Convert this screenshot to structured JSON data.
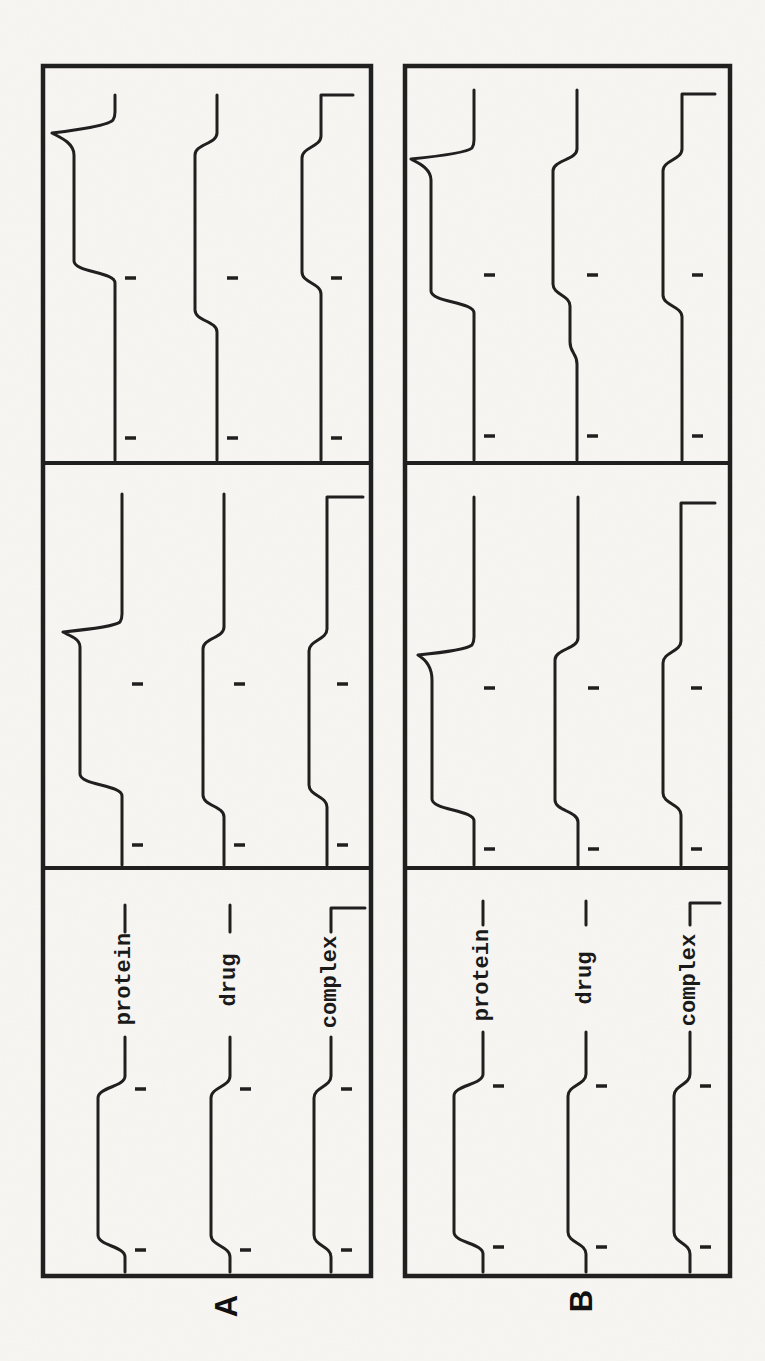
{
  "figure": {
    "kind": "scanned moving-boundary trace figure, rotated 90 degrees counterclockwise",
    "panel_letters": [
      "A",
      "B"
    ],
    "species_labels": [
      "protein",
      "drug",
      "complex"
    ],
    "ink_color": "#1c1c1c",
    "paper_color": "#f8f7f3"
  },
  "chart_data": {
    "type": "line",
    "title": "",
    "legend_position": "inline-left-section",
    "grid": false,
    "logical_canvas": {
      "width": 1361,
      "height": 765
    },
    "dividers_x": [
      493,
      898
    ],
    "panels": [
      {
        "id": "A",
        "letter": "A",
        "box": {
          "x1": 85,
          "y1": 43,
          "x2": 1295,
          "y2": 371
        },
        "sections": [
          {
            "x1": 85,
            "x2": 493,
            "ticks": [
              111,
              272
            ],
            "traces": [
              {
                "species": "protein",
                "base": 125,
                "plateau": 98,
                "zone": [
                  115,
                  274
                ],
                "line_start": 89,
                "line_end": 324,
                "label": {
                  "text": "protein",
                  "cx": 382
                },
                "dash": [
                  429,
                  456
                ]
              },
              {
                "species": "drug",
                "base": 230,
                "plateau": 211,
                "zone": [
                  115,
                  274
                ],
                "line_start": 89,
                "line_end": 324,
                "label": {
                  "text": "drug",
                  "cx": 381
                },
                "dash": [
                  429,
                  456
                ]
              },
              {
                "species": "complex",
                "base": 331,
                "plateau": 314,
                "zone": [
                  115,
                  274
                ],
                "line_start": 89,
                "line_end": 324,
                "label": {
                  "text": "complex",
                  "cx": 379
                },
                "dash": [
                  429,
                  453
                ],
                "end_drop": 365
              }
            ]
          },
          {
            "x1": 493,
            "x2": 898,
            "ticks": [
              516,
              677
            ],
            "traces": [
              {
                "species": "protein",
                "base": 122,
                "plateau": 80,
                "zone": [
                  576,
                  714
                ],
                "line_start": 496,
                "line_end": 867,
                "spike": {
                  "tip_x": 729,
                  "tip_y": 63,
                  "fall_w": 10
                }
              },
              {
                "species": "drug",
                "base": 224,
                "plateau": 203,
                "zone": [
                  555,
                  723
                ],
                "line_start": 496,
                "line_end": 867
              },
              {
                "species": "complex",
                "base": 327,
                "plateau": 309,
                "zone": [
                  565,
                  721
                ],
                "line_start": 496,
                "line_end": 864,
                "end_drop": 363
              }
            ]
          },
          {
            "x1": 898,
            "x2": 1295,
            "ticks": [
              923,
              1083
            ],
            "traces": [
              {
                "species": "protein",
                "base": 115,
                "plateau": 74,
                "zone": [
                  1089,
                  1206
                ],
                "line_start": 901,
                "line_end": 1266,
                "spike": {
                  "tip_x": 1228,
                  "tip_y": 52,
                  "fall_w": 13
                }
              },
              {
                "species": "drug",
                "base": 217,
                "plateau": 195,
                "zone": [
                  1040,
                  1217
                ],
                "line_start": 901,
                "line_end": 1266
              },
              {
                "species": "complex",
                "base": 321,
                "plateau": 302,
                "zone": [
                  1078,
                  1214
                ],
                "line_start": 901,
                "line_end": 1266,
                "end_drop": 353
              }
            ]
          }
        ]
      },
      {
        "id": "B",
        "letter": "B",
        "box": {
          "x1": 85,
          "y1": 405,
          "x2": 1295,
          "y2": 730
        },
        "sections": [
          {
            "x1": 85,
            "x2": 493,
            "ticks": [
              114,
              275
            ],
            "traces": [
              {
                "species": "protein",
                "base": 483,
                "plateau": 454,
                "zone": [
                  118,
                  276
                ],
                "line_start": 89,
                "line_end": 329,
                "label": {
                  "text": "protein",
                  "cx": 386
                },
                "dash": [
                  436,
                  460
                ]
              },
              {
                "species": "drug",
                "base": 586,
                "plateau": 568,
                "zone": [
                  118,
                  276
                ],
                "line_start": 89,
                "line_end": 329,
                "label": {
                  "text": "drug",
                  "cx": 383
                },
                "dash": [
                  436,
                  460
                ]
              },
              {
                "species": "complex",
                "base": 690,
                "plateau": 674,
                "zone": [
                  118,
                  276
                ],
                "line_start": 89,
                "line_end": 329,
                "label": {
                  "text": "complex",
                  "cx": 381
                },
                "dash": [
                  436,
                  458
                ],
                "end_drop": 720
              }
            ]
          },
          {
            "x1": 493,
            "x2": 898,
            "ticks": [
              512,
              673
            ],
            "traces": [
              {
                "species": "protein",
                "base": 474,
                "plateau": 432,
                "zone": [
                  551,
                  681
                ],
                "line_start": 496,
                "line_end": 864,
                "spike": {
                  "tip_x": 706,
                  "tip_y": 418,
                  "fall_w": 10
                }
              },
              {
                "species": "drug",
                "base": 578,
                "plateau": 555,
                "zone": [
                  550,
                  712
                ],
                "line_start": 496,
                "line_end": 864
              },
              {
                "species": "complex",
                "base": 681,
                "plateau": 663,
                "zone": [
                  557,
                  709
                ],
                "line_start": 496,
                "line_end": 858,
                "end_drop": 715
              }
            ]
          },
          {
            "x1": 898,
            "x2": 1295,
            "ticks": [
              925,
              1086
            ],
            "traces": [
              {
                "species": "protein",
                "base": 474,
                "plateau": 431,
                "zone": [
                  1059,
                  1181
                ],
                "line_start": 901,
                "line_end": 1271,
                "spike": {
                  "tip_x": 1202,
                  "tip_y": 411,
                  "fall_w": 11
                }
              },
              {
                "species": "drug",
                "base": 577,
                "plateau": 553,
                "zone": [
                  1066,
                  1201
                ],
                "line_start": 901,
                "line_end": 1271,
                "pre_zone": {
                  "x": 1008,
                  "level": 570
                }
              },
              {
                "species": "complex",
                "base": 682,
                "plateau": 663,
                "zone": [
                  1055,
                  1201
                ],
                "line_start": 901,
                "line_end": 1267,
                "end_drop": 715
              }
            ]
          }
        ]
      }
    ]
  }
}
